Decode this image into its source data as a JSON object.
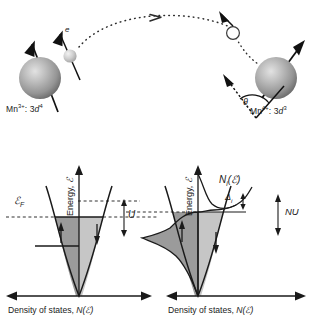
{
  "figure": {
    "caption_absent": true,
    "top_panel": {
      "name": "double-exchange-hopping-diagram",
      "left_ion_label": "Mn3+: 3d4",
      "left_ion_label_base": "Mn",
      "left_ion_charge": "3+",
      "left_ion_config_prefix": ": 3",
      "left_ion_orbital": "d",
      "left_ion_count": "4",
      "right_ion_label": "Mn4+: 3d3",
      "right_ion_label_base": "Mn",
      "right_ion_charge": "4+",
      "right_ion_config_prefix": ": 3",
      "right_ion_orbital": "d",
      "right_ion_count": "3",
      "electron_label": "e",
      "hole_label": "",
      "angle_label": "θ",
      "hop_direction": "left-to-right",
      "colors": {
        "sphere": "#9a9a9a",
        "sphere_highlight": "#d8d8d8",
        "electron": "#c9c9c9",
        "arrow": "#111111",
        "dotted_path": "#2b2b2b"
      }
    },
    "dos_panels": [
      {
        "name": "dos-unpolarized",
        "y_axis_label_prefix": "Energy, ",
        "y_axis_label_symbol": "ℰ",
        "x_axis_label_prefix": "Density of states, ",
        "x_axis_label_symbol": "N(ℰ)",
        "fermi_label": "ℰ",
        "fermi_label_sub": "F",
        "splitting_label": "U",
        "spin_up_arrow": "↑",
        "spin_down_arrow": "↓",
        "band_shape": "parabolic",
        "fill_up_color": "#9b9b9b",
        "fill_down_color": "#c6c6c6",
        "up_band_filled_to": "fermi-level",
        "down_band_filled_to": "fermi-level",
        "extra_level_line": true
      },
      {
        "name": "dos-spin-polarized",
        "y_axis_label_prefix": "Energy, ",
        "y_axis_label_symbol": "ℰ",
        "x_axis_label_prefix": "Density of states, ",
        "x_axis_label_symbol": "N(ℰ)",
        "dos_curve_label_base": "N",
        "dos_curve_label_sub": "i",
        "dos_curve_label_arg": "(ℰ)",
        "delta_label": "Δ",
        "delta_label_sub": "i",
        "exchange_label": "NU",
        "spin_up_arrow": "↑",
        "spin_down_arrow": "↓",
        "band_shape": "parabolic-with-impurity-peak",
        "fill_up_color": "#9b9b9b",
        "fill_down_color": "#c6c6c6"
      }
    ]
  }
}
